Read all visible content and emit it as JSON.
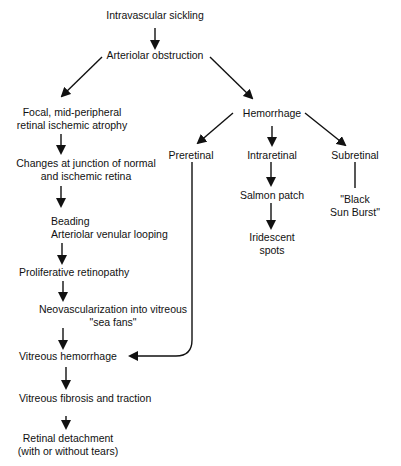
{
  "diagram": {
    "type": "flowchart",
    "colors": {
      "background": "#ffffff",
      "text": "#111111",
      "arrow": "#111111"
    },
    "nodes": {
      "intravascular": "Intravascular sickling",
      "arteriolar": "Arteriolar obstruction",
      "focal_1": "Focal, mid-peripheral",
      "focal_2": "retinal ischemic atrophy",
      "changes_1": "Changes at junction of normal",
      "changes_2": "and ischemic retina",
      "beading_1": "Beading",
      "beading_2": "Arteriolar venular looping",
      "proliferative": "Proliferative retinopathy",
      "neovasc_1": "Neovascularization into vitreous",
      "neovasc_2": "\"sea fans\"",
      "vitreous_hem": "Vitreous hemorrhage",
      "vitreous_fib": "Vitreous fibrosis and traction",
      "detach_1": "Retinal detachment",
      "detach_2": "(with or without tears)",
      "hemorrhage": "Hemorrhage",
      "preretinal": "Preretinal",
      "intraretinal": "Intraretinal",
      "subretinal": "Subretinal",
      "salmon": "Salmon patch",
      "iridescent_1": "Iridescent",
      "iridescent_2": "spots",
      "sunburst_1": "\"Black",
      "sunburst_2": "Sun Burst\""
    },
    "edges": [
      [
        "Intravascular sickling",
        "Arteriolar obstruction"
      ],
      [
        "Arteriolar obstruction",
        "Focal, mid-peripheral retinal ischemic atrophy"
      ],
      [
        "Arteriolar obstruction",
        "Hemorrhage"
      ],
      [
        "Focal, mid-peripheral retinal ischemic atrophy",
        "Changes at junction of normal and ischemic retina"
      ],
      [
        "Changes at junction of normal and ischemic retina",
        "Beading / Arteriolar venular looping"
      ],
      [
        "Beading / Arteriolar venular looping",
        "Proliferative retinopathy"
      ],
      [
        "Proliferative retinopathy",
        "Neovascularization into vitreous \"sea fans\""
      ],
      [
        "Neovascularization into vitreous \"sea fans\"",
        "Vitreous hemorrhage"
      ],
      [
        "Vitreous hemorrhage",
        "Vitreous fibrosis and traction"
      ],
      [
        "Vitreous fibrosis and traction",
        "Retinal detachment (with or without tears)"
      ],
      [
        "Hemorrhage",
        "Preretinal"
      ],
      [
        "Hemorrhage",
        "Intraretinal"
      ],
      [
        "Hemorrhage",
        "Subretinal"
      ],
      [
        "Preretinal",
        "Vitreous hemorrhage"
      ],
      [
        "Intraretinal",
        "Salmon patch"
      ],
      [
        "Salmon patch",
        "Iridescent spots"
      ],
      [
        "Subretinal",
        "\"Black Sun Burst\""
      ]
    ]
  }
}
